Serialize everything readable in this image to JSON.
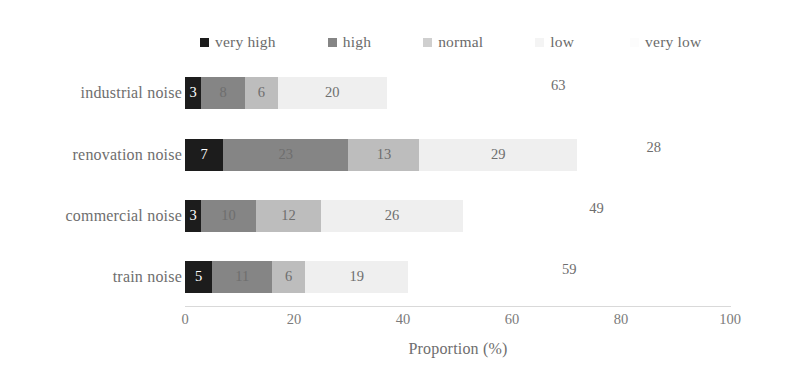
{
  "chart_data": {
    "type": "bar",
    "subtype": "stacked-horizontal-100pct",
    "title": "",
    "xlabel": "Proportion (%)",
    "ylabel": "",
    "xlim": [
      0,
      100
    ],
    "xticks": [
      0,
      20,
      40,
      60,
      80,
      100
    ],
    "xticklabels": [
      "0",
      "20",
      "40",
      "60",
      "80",
      "100"
    ],
    "grid": false,
    "legend_position": "top",
    "categories": [
      "industrial noise",
      "renovation noise",
      "commercial noise",
      "train noise"
    ],
    "series": [
      {
        "name": "very high",
        "color": "#1c1c1c",
        "label_color": "#ffffff",
        "values": [
          3,
          7,
          3,
          5
        ]
      },
      {
        "name": "high",
        "color": "#858585",
        "label_color": "#6e6e6e",
        "values": [
          8,
          23,
          10,
          11
        ]
      },
      {
        "name": "normal",
        "color": "#bdbdbd",
        "label_color": "#6e6e6e",
        "values": [
          6,
          13,
          12,
          6
        ]
      },
      {
        "name": "low",
        "color": "#efefef",
        "label_color": "#6e6e6e",
        "values": [
          20,
          29,
          26,
          19
        ]
      },
      {
        "name": "very low",
        "color": "#ffffff",
        "label_color": "#6e6e6e",
        "values": [
          63,
          28,
          49,
          59
        ]
      }
    ],
    "rows": [
      {
        "category": "industrial noise",
        "very high": 3,
        "high": 8,
        "normal": 6,
        "low": 20,
        "very low": 63,
        "total": 100
      },
      {
        "category": "renovation noise",
        "very high": 7,
        "high": 23,
        "normal": 13,
        "low": 29,
        "very low": 28,
        "total": 100
      },
      {
        "category": "commercial noise",
        "very high": 3,
        "high": 10,
        "normal": 12,
        "low": 26,
        "very low": 49,
        "total": 100
      },
      {
        "category": "train noise",
        "very high": 5,
        "high": 11,
        "normal": 6,
        "low": 19,
        "very low": 59,
        "total": 100
      }
    ],
    "data_labels": {
      "industrial noise": [
        "3",
        "8",
        "6",
        "20",
        "63"
      ],
      "renovation noise": [
        "7",
        "23",
        "13",
        "29",
        "28"
      ],
      "commercial noise": [
        "3",
        "10",
        "12",
        "26",
        "49"
      ],
      "train noise": [
        "5",
        "11",
        "6",
        "19",
        "59"
      ]
    }
  },
  "legend": {
    "items": [
      {
        "label": "very high",
        "color": "#1c1c1c"
      },
      {
        "label": "high",
        "color": "#858585"
      },
      {
        "label": "normal",
        "color": "#cfcfcf"
      },
      {
        "label": "low",
        "color": "#f2f2f2"
      },
      {
        "label": "very low",
        "color": "#fbfbfb"
      }
    ]
  },
  "axis": {
    "title": "Proportion (%)",
    "ticks": [
      "0",
      "20",
      "40",
      "60",
      "80",
      "100"
    ]
  }
}
